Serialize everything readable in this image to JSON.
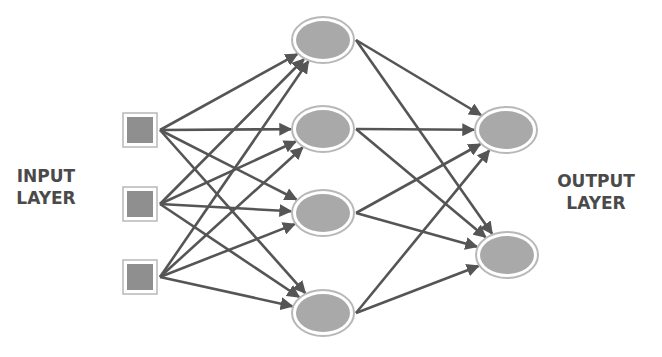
{
  "labels": {
    "input": [
      "INPUT",
      "LAYER"
    ],
    "output": [
      "OUTPUT",
      "LAYER"
    ]
  },
  "colors": {
    "edge": "#555555",
    "node_fill": "#a9a9a9",
    "node_ring": "#b8b8b8",
    "text": "#4a4a4a"
  },
  "layers": {
    "input": [
      {
        "id": "i1",
        "x": 140,
        "y": 130
      },
      {
        "id": "i2",
        "x": 140,
        "y": 204
      },
      {
        "id": "i3",
        "x": 140,
        "y": 277
      }
    ],
    "hidden": [
      {
        "id": "h1",
        "x": 323,
        "y": 40
      },
      {
        "id": "h2",
        "x": 323,
        "y": 129
      },
      {
        "id": "h3",
        "x": 323,
        "y": 213
      },
      {
        "id": "h4",
        "x": 323,
        "y": 313
      }
    ],
    "output": [
      {
        "id": "o1",
        "x": 506,
        "y": 130
      },
      {
        "id": "o2",
        "x": 507,
        "y": 255
      }
    ]
  }
}
